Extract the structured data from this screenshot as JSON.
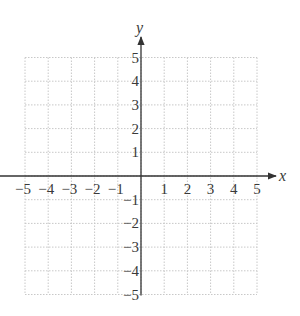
{
  "chart_data": {
    "type": "scatter",
    "title": "",
    "xlabel": "x",
    "ylabel": "y",
    "xlim": [
      -5,
      5
    ],
    "ylim": [
      -5,
      5
    ],
    "x_ticks": [
      -5,
      -4,
      -3,
      -2,
      -1,
      1,
      2,
      3,
      4,
      5
    ],
    "y_ticks": [
      -5,
      -4,
      -3,
      -2,
      -1,
      1,
      2,
      3,
      4,
      5
    ],
    "x_tick_labels": [
      "−5",
      "−4",
      "−3",
      "−2",
      "−1",
      "1",
      "2",
      "3",
      "4",
      "5"
    ],
    "y_tick_labels": [
      "−5",
      "−4",
      "−3",
      "−2",
      "−1",
      "1",
      "2",
      "3",
      "4",
      "5"
    ],
    "grid": true,
    "grid_style": "dotted",
    "legend": null,
    "series": []
  },
  "layout": {
    "origin_px": [
      141,
      176
    ],
    "unit_px_x": 23.2,
    "unit_px_y": 23.7,
    "grid_color": "#c8c8c8",
    "axis_color": "#333333"
  }
}
